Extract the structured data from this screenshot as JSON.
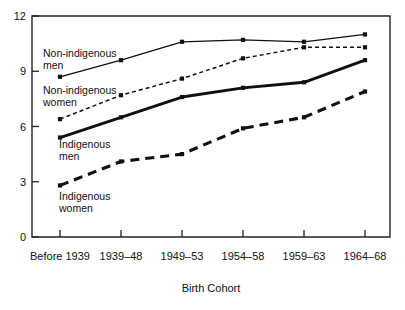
{
  "figure": {
    "clipped_title_fragment": "g",
    "plot_frame": true
  },
  "chart_data": {
    "type": "line",
    "title": "",
    "subtitle": "",
    "xlabel": "Birth Cohort",
    "ylabel": "",
    "categories": [
      "Before 1939",
      "1939–48",
      "1949–53",
      "1954–58",
      "1959–63",
      "1964–68"
    ],
    "yticks": [
      0,
      3,
      6,
      9,
      12
    ],
    "ylim": [
      0,
      12
    ],
    "grid": false,
    "legend_position": "inline-annotations",
    "markers": "square",
    "series": [
      {
        "name": "Non-indigenous men",
        "style": "thin-solid",
        "values": [
          8.7,
          9.6,
          10.6,
          10.7,
          10.6,
          11.0
        ]
      },
      {
        "name": "Non-indigenous women",
        "style": "thin-dotted",
        "values": [
          6.4,
          7.7,
          8.6,
          9.7,
          10.3,
          10.3
        ]
      },
      {
        "name": "Indigenous men",
        "style": "thick-solid",
        "values": [
          5.4,
          6.5,
          7.6,
          8.1,
          8.4,
          9.6
        ]
      },
      {
        "name": "Indigenous women",
        "style": "thick-dashed",
        "values": [
          2.8,
          4.1,
          4.5,
          5.9,
          6.5,
          7.9
        ]
      }
    ],
    "annotations": [
      {
        "text_line1": "Non-indigenous",
        "text_line2": "men",
        "x": 43,
        "y": 57
      },
      {
        "text_line1": "Non-indigenous",
        "text_line2": "women",
        "x": 43,
        "y": 94
      },
      {
        "text_line1": "Indigenous",
        "text_line2": "men",
        "x": 59,
        "y": 148
      },
      {
        "text_line1": "Indigenous",
        "text_line2": "women",
        "x": 59,
        "y": 200
      }
    ]
  }
}
